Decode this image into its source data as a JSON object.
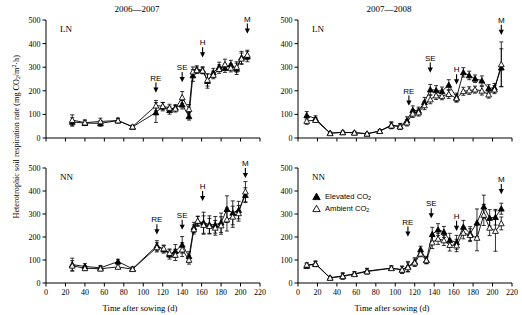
{
  "figure": {
    "ylabel": "Heterotrophic soil respiration rate (mg CO2/m2·h)",
    "xlabel": "Time after sowing (d)",
    "legend": [
      {
        "key": "elevated",
        "label": "Elevated CO",
        "sub": "2",
        "marker": "filled-triangle"
      },
      {
        "key": "ambient",
        "label": "Ambient CO",
        "sub": "2",
        "marker": "open-triangle"
      }
    ],
    "axis": {
      "xticks": [
        0,
        20,
        40,
        60,
        80,
        100,
        120,
        140,
        160,
        180,
        200,
        220
      ],
      "yticks": [
        0,
        100,
        200,
        300,
        400,
        500
      ],
      "xlim": [
        0,
        220
      ],
      "ylim": [
        0,
        500
      ]
    }
  },
  "chart_data": [
    {
      "id": "panel-tl",
      "type": "line",
      "title": "2006—2007",
      "panel_label": "LN",
      "xlabel": "",
      "ylabel": "",
      "xlim": [
        0,
        220
      ],
      "ylim": [
        0,
        500
      ],
      "xticks": [
        0,
        20,
        40,
        60,
        80,
        100,
        120,
        140,
        160,
        180,
        200,
        220
      ],
      "yticks": [
        0,
        100,
        200,
        300,
        400,
        500
      ],
      "grid": false,
      "legend_position": "none",
      "annotations": [
        {
          "text": "RE",
          "x": 113,
          "y": 205
        },
        {
          "text": "SE",
          "x": 140,
          "y": 250
        },
        {
          "text": "H",
          "x": 161,
          "y": 355
        },
        {
          "text": "M",
          "x": 207,
          "y": 455
        }
      ],
      "series": [
        {
          "name": "Elevated CO2",
          "marker": "filled-triangle",
          "x": [
            27,
            40,
            56,
            74,
            89,
            113,
            120,
            127,
            133,
            140,
            147,
            151,
            155,
            161,
            166,
            172,
            178,
            184,
            190,
            196,
            201,
            207
          ],
          "y": [
            68,
            63,
            62,
            74,
            47,
            108,
            133,
            118,
            129,
            141,
            92,
            265,
            291,
            288,
            241,
            277,
            301,
            296,
            311,
            293,
            341,
            345
          ],
          "yerr": [
            18,
            10,
            12,
            9,
            5,
            42,
            18,
            17,
            12,
            18,
            16,
            25,
            15,
            14,
            30,
            18,
            20,
            18,
            18,
            24,
            26,
            22
          ]
        },
        {
          "name": "Ambient CO2",
          "marker": "open-triangle",
          "x": [
            27,
            40,
            56,
            74,
            89,
            113,
            120,
            127,
            133,
            140,
            147,
            151,
            155,
            161,
            166,
            172,
            178,
            184,
            190,
            196,
            201,
            207
          ],
          "y": [
            76,
            65,
            70,
            74,
            48,
            137,
            135,
            127,
            124,
            172,
            122,
            281,
            287,
            285,
            246,
            267,
            292,
            312,
            297,
            301,
            336,
            352
          ],
          "yerr": [
            22,
            12,
            14,
            10,
            6,
            22,
            15,
            16,
            14,
            25,
            20,
            20,
            14,
            13,
            26,
            16,
            18,
            22,
            17,
            22,
            24,
            20
          ]
        }
      ]
    },
    {
      "id": "panel-tr",
      "type": "line",
      "title": "2007—2008",
      "panel_label": "LN",
      "xlabel": "",
      "ylabel": "",
      "xlim": [
        0,
        220
      ],
      "ylim": [
        0,
        500
      ],
      "xticks": [
        0,
        20,
        40,
        60,
        80,
        100,
        120,
        140,
        160,
        180,
        200,
        220
      ],
      "yticks": [
        0,
        100,
        200,
        300,
        400,
        500
      ],
      "grid": false,
      "legend_position": "none",
      "annotations": [
        {
          "text": "RE",
          "x": 114,
          "y": 150
        },
        {
          "text": "SE",
          "x": 136,
          "y": 290
        },
        {
          "text": "H",
          "x": 163,
          "y": 240
        },
        {
          "text": "M",
          "x": 209,
          "y": 450
        }
      ],
      "series": [
        {
          "name": "Elevated CO2",
          "marker": "filled-triangle",
          "x": [
            9,
            18,
            33,
            46,
            58,
            71,
            84,
            96,
            105,
            112,
            118,
            124,
            130,
            136,
            142,
            148,
            155,
            163,
            170,
            176,
            182,
            189,
            196,
            202,
            209
          ],
          "y": [
            96,
            82,
            21,
            24,
            23,
            18,
            30,
            55,
            50,
            74,
            118,
            115,
            152,
            205,
            202,
            198,
            225,
            172,
            278,
            265,
            251,
            243,
            210,
            213,
            298
          ],
          "yerr": [
            16,
            12,
            5,
            5,
            4,
            4,
            6,
            14,
            12,
            16,
            18,
            16,
            20,
            22,
            20,
            18,
            22,
            18,
            20,
            18,
            16,
            20,
            16,
            18,
            80
          ]
        },
        {
          "name": "Ambient CO2",
          "marker": "open-triangle",
          "x": [
            9,
            18,
            33,
            46,
            58,
            71,
            84,
            96,
            105,
            112,
            118,
            124,
            130,
            136,
            142,
            148,
            155,
            163,
            170,
            176,
            182,
            189,
            196,
            202,
            209
          ],
          "y": [
            72,
            76,
            20,
            24,
            22,
            18,
            29,
            52,
            48,
            65,
            103,
            108,
            138,
            163,
            180,
            178,
            186,
            168,
            198,
            201,
            205,
            200,
            184,
            205,
            312
          ],
          "yerr": [
            14,
            10,
            5,
            5,
            4,
            4,
            6,
            13,
            11,
            14,
            16,
            15,
            18,
            18,
            17,
            16,
            18,
            16,
            17,
            16,
            15,
            18,
            15,
            17,
            95
          ]
        }
      ]
    },
    {
      "id": "panel-bl",
      "type": "line",
      "title": "",
      "panel_label": "NN",
      "xlabel": "Time after sowing (d)",
      "ylabel": "",
      "xlim": [
        0,
        220
      ],
      "ylim": [
        0,
        500
      ],
      "xticks": [
        0,
        20,
        40,
        60,
        80,
        100,
        120,
        140,
        160,
        180,
        200,
        220
      ],
      "yticks": [
        0,
        100,
        200,
        300,
        400,
        500
      ],
      "grid": false,
      "legend_position": "none",
      "annotations": [
        {
          "text": "RE",
          "x": 114,
          "y": 225
        },
        {
          "text": "SE",
          "x": 140,
          "y": 245
        },
        {
          "text": "H",
          "x": 161,
          "y": 370
        },
        {
          "text": "M",
          "x": 205,
          "y": 470
        }
      ],
      "series": [
        {
          "name": "Elevated CO2",
          "marker": "filled-triangle",
          "x": [
            27,
            40,
            56,
            74,
            89,
            114,
            121,
            127,
            133,
            140,
            147,
            152,
            156,
            162,
            168,
            174,
            180,
            186,
            192,
            198,
            205
          ],
          "y": [
            80,
            72,
            66,
            93,
            62,
            162,
            146,
            124,
            139,
            166,
            116,
            242,
            268,
            262,
            254,
            253,
            262,
            321,
            305,
            317,
            382
          ],
          "yerr": [
            28,
            12,
            10,
            10,
            8,
            22,
            16,
            20,
            28,
            36,
            20,
            22,
            22,
            46,
            38,
            36,
            42,
            58,
            52,
            38,
            32
          ]
        },
        {
          "name": "Ambient CO2",
          "marker": "open-triangle",
          "x": [
            27,
            40,
            56,
            74,
            89,
            114,
            121,
            127,
            133,
            140,
            147,
            152,
            156,
            162,
            168,
            174,
            180,
            186,
            192,
            198,
            205
          ],
          "y": [
            75,
            64,
            62,
            70,
            60,
            155,
            150,
            130,
            122,
            145,
            100,
            233,
            270,
            252,
            247,
            240,
            250,
            276,
            288,
            303,
            397
          ],
          "yerr": [
            22,
            10,
            9,
            9,
            7,
            20,
            15,
            18,
            24,
            30,
            18,
            20,
            20,
            40,
            34,
            32,
            38,
            50,
            46,
            34,
            44
          ]
        }
      ]
    },
    {
      "id": "panel-br",
      "type": "line",
      "title": "",
      "panel_label": "NN",
      "xlabel": "Time after sowing (d)",
      "ylabel": "",
      "xlim": [
        0,
        220
      ],
      "ylim": [
        0,
        500
      ],
      "xticks": [
        0,
        20,
        40,
        60,
        80,
        100,
        120,
        140,
        160,
        180,
        200,
        220
      ],
      "yticks": [
        0,
        100,
        200,
        300,
        400,
        500
      ],
      "grid": false,
      "legend_position": "inside-left",
      "annotations": [
        {
          "text": "RE",
          "x": 113,
          "y": 215
        },
        {
          "text": "SE",
          "x": 137,
          "y": 295
        },
        {
          "text": "H",
          "x": 163,
          "y": 240
        },
        {
          "text": "M",
          "x": 209,
          "y": 400
        }
      ],
      "series": [
        {
          "name": "Elevated CO2",
          "marker": "filled-triangle",
          "x": [
            9,
            18,
            33,
            46,
            58,
            71,
            96,
            107,
            113,
            120,
            126,
            132,
            138,
            144,
            150,
            156,
            163,
            170,
            177,
            184,
            191,
            197,
            203,
            209
          ],
          "y": [
            74,
            84,
            23,
            31,
            40,
            52,
            65,
            58,
            72,
            92,
            146,
            100,
            212,
            232,
            222,
            186,
            177,
            244,
            215,
            262,
            332,
            283,
            286,
            323
          ],
          "yerr": [
            10,
            12,
            6,
            14,
            10,
            12,
            10,
            16,
            22,
            18,
            14,
            16,
            30,
            26,
            24,
            30,
            30,
            28,
            30,
            60,
            50,
            36,
            34,
            24
          ]
        },
        {
          "name": "Ambient CO2",
          "marker": "open-triangle",
          "x": [
            9,
            18,
            33,
            46,
            58,
            71,
            96,
            107,
            113,
            120,
            126,
            132,
            138,
            144,
            150,
            156,
            163,
            170,
            177,
            184,
            191,
            197,
            203,
            209
          ],
          "y": [
            79,
            82,
            22,
            29,
            38,
            50,
            64,
            57,
            68,
            88,
            127,
            98,
            176,
            192,
            185,
            165,
            163,
            218,
            208,
            196,
            296,
            240,
            226,
            259
          ],
          "yerr": [
            9,
            11,
            5,
            12,
            9,
            11,
            9,
            14,
            20,
            16,
            13,
            14,
            26,
            24,
            22,
            26,
            27,
            26,
            28,
            56,
            46,
            34,
            88,
            28
          ]
        }
      ]
    }
  ]
}
